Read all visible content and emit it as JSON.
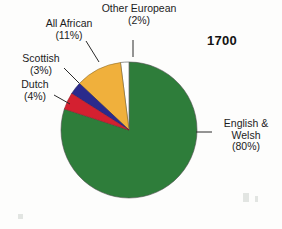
{
  "chart_data": {
    "type": "pie",
    "title": "1700",
    "categories": [
      "English & Welsh",
      "All African",
      "Dutch",
      "Scottish",
      "Other European"
    ],
    "values": [
      80,
      11,
      4,
      3,
      2
    ],
    "unit": "%",
    "slices": [
      {
        "label": "English & Welsh",
        "label_line1": "English &",
        "label_line2": "Welsh",
        "value": 80,
        "percent_text": "(80%)",
        "color": "#2E7D3A"
      },
      {
        "label": "All African",
        "label_line1": "All African",
        "label_line2": "",
        "value": 11,
        "percent_text": "(11%)",
        "color": "#F0B03C"
      },
      {
        "label": "Dutch",
        "label_line1": "Dutch",
        "label_line2": "",
        "value": 4,
        "percent_text": "(4%)",
        "color": "#D42030"
      },
      {
        "label": "Scottish",
        "label_line1": "Scottish",
        "label_line2": "",
        "value": 3,
        "percent_text": "(3%)",
        "color": "#2A2A8C"
      },
      {
        "label": "Other European",
        "label_line1": "Other European",
        "label_line2": "",
        "value": 2,
        "percent_text": "(2%)",
        "color": "#FFFFFF"
      }
    ],
    "legend": "none",
    "grid": false,
    "xlabel": "",
    "ylabel": ""
  },
  "labels": {
    "other_european": {
      "name": "Other European",
      "percent": "(2%)"
    },
    "all_african": {
      "name": "All African",
      "percent": "(11%)"
    },
    "scottish": {
      "name": "Scottish",
      "percent": "(3%)"
    },
    "dutch": {
      "name": "Dutch",
      "percent": "(4%)"
    },
    "english_welsh": {
      "name_line1": "English &",
      "name_line2": "Welsh",
      "percent": "(80%)"
    }
  },
  "year": "1700",
  "colors": {
    "english_welsh": "#2E7D3A",
    "all_african": "#F0B03C",
    "dutch": "#D42030",
    "scottish": "#2A2A8C",
    "other_european": "#FFFFFF",
    "outline": "#5a5a5a",
    "leader_line": "#2a2a2a",
    "text": "#1c1c1c",
    "background": "#fdfdfc"
  }
}
